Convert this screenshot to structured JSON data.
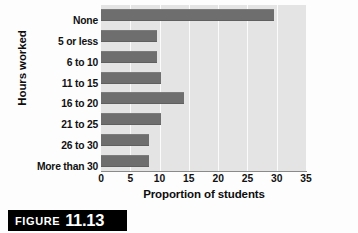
{
  "figure": {
    "caption_word": "FIGURE",
    "caption_number": "11.13"
  },
  "chart_data": {
    "type": "bar",
    "orientation": "horizontal",
    "title": "",
    "xlabel": "Proportion of students",
    "ylabel": "Hours worked",
    "categories": [
      "None",
      "5 or less",
      "6 to 10",
      "11 to 15",
      "16 to 20",
      "21 to 25",
      "26 to 30",
      "More than 30"
    ],
    "values": [
      29.5,
      9.6,
      9.6,
      10.2,
      14.2,
      10.2,
      8.2,
      8.2
    ],
    "xlim": [
      0,
      35
    ],
    "xticks": [
      0,
      5,
      10,
      15,
      20,
      25,
      30,
      35
    ],
    "xtick_labels": [
      "0",
      "5",
      "10",
      "15",
      "20",
      "25",
      "30",
      "35"
    ],
    "grid": "vertical",
    "legend": "none",
    "colors": {
      "bar": "#6e6e6e",
      "plot_background": "#e4e4e4",
      "gridline": "#fbfbfb",
      "axis": "#8a8a8a",
      "text": "#111111",
      "caption_background": "#000000",
      "caption_text": "#ffffff",
      "page_background": "#fdfdfd"
    }
  }
}
